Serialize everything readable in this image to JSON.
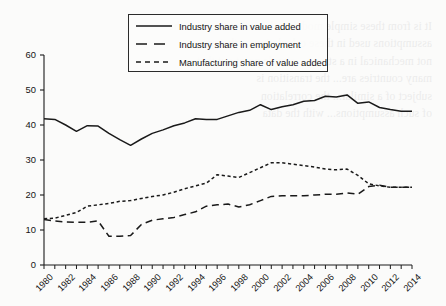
{
  "chart_data": {
    "type": "line",
    "title": "",
    "subtitle": "",
    "xlabel": "",
    "ylabel": "",
    "xlim": [
      1980,
      2014
    ],
    "ylim": [
      0,
      60
    ],
    "grid": false,
    "legend_position": "top-center",
    "y_ticks": [
      0,
      10,
      20,
      30,
      40,
      50,
      60
    ],
    "x_ticks": [
      1980,
      1981,
      1982,
      1983,
      1984,
      1985,
      1986,
      1987,
      1988,
      1989,
      1990,
      1991,
      1992,
      1993,
      1994,
      1995,
      1996,
      1997,
      1998,
      1999,
      2000,
      2001,
      2002,
      2003,
      2004,
      2005,
      2006,
      2007,
      2008,
      2009,
      2010,
      2011,
      2012,
      2013,
      2014
    ],
    "x_tick_labels": [
      "1980",
      "",
      "1982",
      "",
      "1984",
      "",
      "1986",
      "",
      "1988",
      "",
      "1990",
      "",
      "1992",
      "",
      "1994",
      "",
      "1996",
      "",
      "1998",
      "",
      "2000",
      "",
      "2002",
      "",
      "2004",
      "",
      "2006",
      "",
      "2008",
      "",
      "2010",
      "",
      "2012",
      "",
      "2014"
    ],
    "x": [
      1980,
      1981,
      1982,
      1983,
      1984,
      1985,
      1986,
      1987,
      1988,
      1989,
      1990,
      1991,
      1992,
      1993,
      1994,
      1995,
      1996,
      1997,
      1998,
      1999,
      2000,
      2001,
      2002,
      2003,
      2004,
      2005,
      2006,
      2007,
      2008,
      2009,
      2010,
      2011,
      2012,
      2013,
      2014
    ],
    "series": [
      {
        "name": "Industry share in value added",
        "style": "solid",
        "color": "#1a1a1a",
        "values": [
          41.8,
          41.6,
          40.0,
          38.2,
          39.8,
          39.7,
          37.6,
          35.8,
          34.2,
          36.0,
          37.6,
          38.6,
          39.8,
          40.6,
          41.8,
          41.6,
          41.6,
          42.6,
          43.6,
          44.2,
          45.8,
          44.4,
          45.2,
          45.8,
          46.8,
          47.0,
          48.2,
          48.0,
          48.6,
          46.2,
          46.6,
          45.0,
          44.4,
          43.9,
          43.9
        ]
      },
      {
        "name": "Industry share in employment",
        "style": "dashed",
        "color": "#1a1a1a",
        "values": [
          13.0,
          12.6,
          12.3,
          12.2,
          12.2,
          12.6,
          8.2,
          8.2,
          8.4,
          11.6,
          12.8,
          13.2,
          13.6,
          14.4,
          15.2,
          16.8,
          17.2,
          17.4,
          16.6,
          17.2,
          18.4,
          19.6,
          19.8,
          19.8,
          19.8,
          20.0,
          20.2,
          20.2,
          20.6,
          20.2,
          22.4,
          22.8,
          22.2,
          22.2,
          22.2
        ]
      },
      {
        "name": "Manufacturing share of value added",
        "style": "dotted-dash",
        "color": "#1a1a1a",
        "values": [
          13.2,
          13.4,
          14.2,
          15.0,
          16.8,
          17.2,
          17.6,
          18.2,
          18.4,
          19.0,
          19.6,
          20.0,
          20.8,
          21.8,
          22.6,
          23.4,
          25.8,
          25.4,
          25.0,
          26.4,
          27.8,
          29.2,
          29.2,
          28.8,
          28.4,
          28.0,
          27.4,
          27.2,
          27.4,
          25.6,
          23.2,
          22.6,
          22.2,
          22.2,
          22.2
        ]
      }
    ]
  },
  "legend": {
    "items": [
      {
        "label": "Industry share in value added",
        "key": "solid-line-key"
      },
      {
        "label": "Industry share in employment",
        "key": "dashed-line-key"
      },
      {
        "label": "Manufacturing share of value added",
        "key": "dotted-dash-line-key"
      }
    ]
  },
  "background_text": "It is from these simple models... the extent to which the\nassumptions used in these calculations... that are\nnot mechanical in a strong... simple point out that\nmany countries are... the transition is\nsubject of a similar... the correlation\nof such assumptions... with the data"
}
